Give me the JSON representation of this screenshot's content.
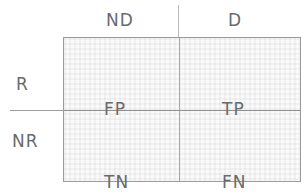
{
  "diagram": {
    "name": "confusion-matrix",
    "colors": {
      "text": "#6a6a6a",
      "box_border": "#9a9a9a",
      "axis_line": "#9c9c9c",
      "divider": "#a8a8a8",
      "fill": "#fafafa",
      "grid": "#ebebeb",
      "background": "#ffffff"
    },
    "column_headers": [
      {
        "key": "nd",
        "label": "ND"
      },
      {
        "key": "d",
        "label": "D"
      }
    ],
    "row_headers": [
      {
        "key": "r",
        "label": "R"
      },
      {
        "key": "nr",
        "label": "NR"
      }
    ],
    "cells": [
      {
        "key": "top_left",
        "row": "R",
        "column": "ND",
        "label": "FP"
      },
      {
        "key": "top_right",
        "row": "R",
        "column": "D",
        "label": "TP"
      },
      {
        "key": "bottom_left",
        "row": "NR",
        "column": "ND",
        "label": "TN"
      },
      {
        "key": "bottom_right",
        "row": "NR",
        "column": "D",
        "label": "FN"
      }
    ]
  }
}
